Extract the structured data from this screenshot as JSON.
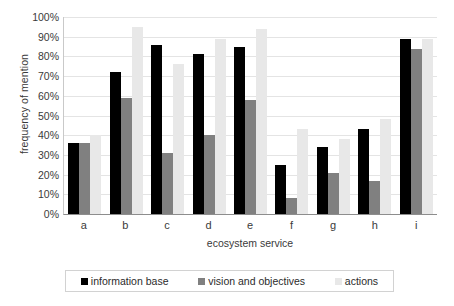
{
  "chart_data": {
    "type": "bar",
    "title": "",
    "xlabel": "ecosystem service",
    "ylabel": "frequency of mention",
    "categories": [
      "a",
      "b",
      "c",
      "d",
      "e",
      "f",
      "g",
      "h",
      "i"
    ],
    "series": [
      {
        "name": "information base",
        "color": "#000000",
        "values": [
          36,
          72,
          86,
          81,
          85,
          25,
          34,
          43,
          89
        ]
      },
      {
        "name": "vision and objectives",
        "color": "#808080",
        "values": [
          36,
          59,
          31,
          40,
          58,
          8,
          21,
          17,
          84
        ]
      },
      {
        "name": "actions",
        "color": "#e8e8e8",
        "values": [
          40,
          95,
          76,
          89,
          94,
          43,
          38,
          48,
          89
        ]
      }
    ],
    "ylim": [
      0,
      100
    ],
    "ytick_labels": [
      "100%",
      "90%",
      "80%",
      "70%",
      "60%",
      "50%",
      "40%",
      "30%",
      "20%",
      "10%",
      "0%"
    ],
    "ytick_values": [
      100,
      90,
      80,
      70,
      60,
      50,
      40,
      30,
      20,
      10,
      0
    ],
    "grid": true,
    "legend_position": "bottom",
    "y_axis_suffix": "%"
  }
}
